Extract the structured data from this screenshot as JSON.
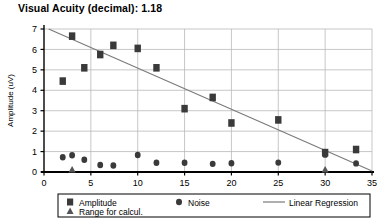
{
  "chart_data": {
    "type": "scatter",
    "title": "Visual Acuity (decimal): 1.18",
    "xlabel": "",
    "ylabel": "Amplitude (uV)",
    "xlim": [
      0,
      35
    ],
    "ylim": [
      0,
      7
    ],
    "xticks": [
      0,
      5,
      10,
      15,
      20,
      25,
      30,
      35
    ],
    "yticks": [
      0,
      1,
      2,
      3,
      4,
      5,
      6,
      7
    ],
    "grid": true,
    "legend_position": "bottom",
    "series": [
      {
        "name": "Amplitude",
        "marker": "square",
        "color": "#3a3a3a",
        "points": [
          {
            "x": 2.0,
            "y": 4.45
          },
          {
            "x": 3.0,
            "y": 6.65
          },
          {
            "x": 4.3,
            "y": 5.1
          },
          {
            "x": 6.0,
            "y": 5.75
          },
          {
            "x": 7.4,
            "y": 6.2
          },
          {
            "x": 10.0,
            "y": 6.05
          },
          {
            "x": 12.0,
            "y": 5.1
          },
          {
            "x": 15.0,
            "y": 3.1
          },
          {
            "x": 18.0,
            "y": 3.65
          },
          {
            "x": 20.0,
            "y": 2.4
          },
          {
            "x": 25.0,
            "y": 2.55
          },
          {
            "x": 30.0,
            "y": 0.95
          },
          {
            "x": 33.3,
            "y": 1.1
          }
        ]
      },
      {
        "name": "Noise",
        "marker": "circle",
        "color": "#3a3a3a",
        "points": [
          {
            "x": 2.0,
            "y": 0.72
          },
          {
            "x": 3.0,
            "y": 0.82
          },
          {
            "x": 4.3,
            "y": 0.6
          },
          {
            "x": 6.0,
            "y": 0.34
          },
          {
            "x": 7.4,
            "y": 0.32
          },
          {
            "x": 10.0,
            "y": 0.83
          },
          {
            "x": 12.0,
            "y": 0.45
          },
          {
            "x": 15.0,
            "y": 0.45
          },
          {
            "x": 18.0,
            "y": 0.4
          },
          {
            "x": 20.0,
            "y": 0.43
          },
          {
            "x": 25.0,
            "y": 0.46
          },
          {
            "x": 30.0,
            "y": 0.85
          },
          {
            "x": 33.3,
            "y": 0.42
          }
        ]
      },
      {
        "name": "Range for calcul.",
        "marker": "triangle",
        "color": "#555555",
        "points": [
          {
            "x": 3.0,
            "y": 0.0
          },
          {
            "x": 30.0,
            "y": 0.0
          }
        ]
      },
      {
        "name": "Linear Regression",
        "marker": "line",
        "color": "#7a7a7a",
        "points": [
          {
            "x": 0.5,
            "y": 7.0
          },
          {
            "x": 35.0,
            "y": 0.05
          }
        ]
      }
    ]
  },
  "legend": {
    "amplitude_label": "Amplitude",
    "noise_label": "Noise",
    "regression_label": "Linear Regression",
    "range_label": "Range for calcul."
  },
  "axes": {
    "y_title": "Amplitude (uV)",
    "x_tick_labels": [
      "0",
      "5",
      "10",
      "15",
      "20",
      "25",
      "30",
      "35"
    ],
    "y_tick_labels": [
      "0",
      "1",
      "2",
      "3",
      "4",
      "5",
      "6",
      "7"
    ]
  }
}
